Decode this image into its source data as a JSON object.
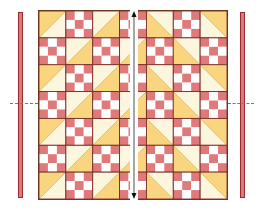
{
  "diagram": {
    "grid": {
      "rows": 7,
      "cols": 7,
      "block_size_px": 27
    },
    "colors": {
      "red": "#e07a7a",
      "white": "#ffffff",
      "yellow": "#f8d57e",
      "cream": "#fdf6df",
      "seam": "#7a2a24",
      "strip_red": "#df7878",
      "strip_border": "#9a2a2e"
    },
    "side_strips": [
      {
        "name": "left-border-strip",
        "x": 18,
        "y": 12,
        "width": 5,
        "height": 186
      },
      {
        "name": "right-border-strip",
        "x": 240,
        "y": 12,
        "width": 5,
        "height": 186
      }
    ],
    "center_strip": {
      "x": 130,
      "y": 10,
      "width": 8,
      "height": 190,
      "arrow": "double-headed-vertical"
    },
    "markers": {
      "left": {
        "y": 103,
        "symbol": "↔"
      },
      "right": {
        "y": 103,
        "symbol": "↔"
      }
    },
    "blocks": [
      [
        "hst-a",
        "np",
        "hst-b",
        "np",
        "hst-c",
        "np",
        "hst-d"
      ],
      [
        "np",
        "hst-b",
        "np",
        "hst-b",
        "np",
        "hst-c",
        "np"
      ],
      [
        "hst-a",
        "np",
        "hst-b",
        "np",
        "hst-c",
        "np",
        "hst-d"
      ],
      [
        "np",
        "hst-b",
        "np",
        "hst-b",
        "np",
        "hst-c",
        "np"
      ],
      [
        "hst-a",
        "np",
        "hst-b",
        "np",
        "hst-c",
        "np",
        "hst-d"
      ],
      [
        "np",
        "hst-b",
        "np",
        "hst-b",
        "np",
        "hst-c",
        "np"
      ],
      [
        "hst-a",
        "np",
        "hst-b",
        "np",
        "hst-c",
        "np",
        "hst-d"
      ]
    ]
  }
}
